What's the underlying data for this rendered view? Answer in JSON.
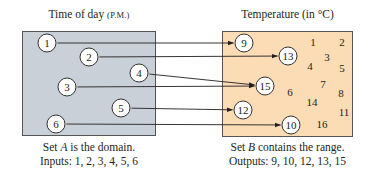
{
  "domain_box": {
    "title": "Time of day",
    "title_suffix": "(P.M.)",
    "fill": "#c9d0d8",
    "caption_line1_pre": "Set ",
    "caption_var": "A",
    "caption_line1_post": " is the domain.",
    "caption_line2": "Inputs: 1, 2, 3, 4, 5, 6",
    "nodes": [
      {
        "label": "1",
        "x": 47,
        "y": 43
      },
      {
        "label": "2",
        "x": 89,
        "y": 57
      },
      {
        "label": "4",
        "x": 139,
        "y": 73
      },
      {
        "label": "3",
        "x": 67,
        "y": 87
      },
      {
        "label": "5",
        "x": 121,
        "y": 108
      },
      {
        "label": "6",
        "x": 56,
        "y": 124
      }
    ]
  },
  "range_box": {
    "title": "Temperature (in °C)",
    "fill": "#fbdcb4",
    "caption_line1_pre": "Set ",
    "caption_var": "B",
    "caption_line1_post": " contains the range.",
    "caption_line2": "Outputs: 9, 10, 12, 13, 15",
    "nodes": [
      {
        "label": "9",
        "x": 244,
        "y": 43
      },
      {
        "label": "13",
        "x": 288,
        "y": 56
      },
      {
        "label": "15",
        "x": 265,
        "y": 86
      },
      {
        "label": "12",
        "x": 243,
        "y": 110
      },
      {
        "label": "10",
        "x": 291,
        "y": 125
      }
    ],
    "loose_numbers": [
      {
        "label": "1",
        "x": 313,
        "y": 42
      },
      {
        "label": "2",
        "x": 342,
        "y": 42
      },
      {
        "label": "3",
        "x": 327,
        "y": 57
      },
      {
        "label": "4",
        "x": 310,
        "y": 66
      },
      {
        "label": "5",
        "x": 342,
        "y": 68
      },
      {
        "label": "7",
        "x": 323,
        "y": 84
      },
      {
        "label": "6",
        "x": 290,
        "y": 92
      },
      {
        "label": "8",
        "x": 341,
        "y": 93
      },
      {
        "label": "14",
        "x": 312,
        "y": 102
      },
      {
        "label": "11",
        "x": 344,
        "y": 112
      },
      {
        "label": "16",
        "x": 322,
        "y": 124
      }
    ]
  },
  "mappings": [
    {
      "from": "1",
      "to": "9"
    },
    {
      "from": "2",
      "to": "13"
    },
    {
      "from": "4",
      "to": "15"
    },
    {
      "from": "3",
      "to": "15"
    },
    {
      "from": "5",
      "to": "12"
    },
    {
      "from": "6",
      "to": "10"
    }
  ]
}
